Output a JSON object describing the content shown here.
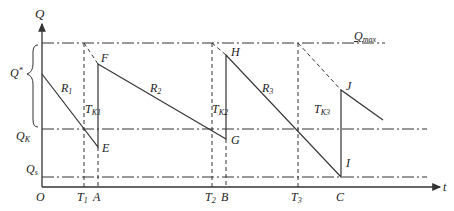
{
  "diagram": {
    "axes": {
      "y_label": "Q",
      "x_label": "t",
      "origin_label": "O"
    },
    "levels": {
      "q_max": {
        "label": "Q",
        "sub": "max"
      },
      "q_k": {
        "label": "Q",
        "sub": "K"
      },
      "q_s": {
        "label": "Q",
        "sub": "s"
      },
      "q_star": {
        "label": "Q",
        "sup": "*"
      }
    },
    "time_marks": [
      {
        "label": "T",
        "sub": "1"
      },
      {
        "label": "A"
      },
      {
        "label": "T",
        "sub": "2"
      },
      {
        "label": "B"
      },
      {
        "label": "T",
        "sub": "3"
      },
      {
        "label": "C"
      }
    ],
    "points": [
      "F",
      "E",
      "H",
      "G",
      "I",
      "J"
    ],
    "segments": [
      {
        "label": "R",
        "sub": "1"
      },
      {
        "label": "R",
        "sub": "2"
      },
      {
        "label": "R",
        "sub": "3"
      }
    ],
    "intervals": [
      {
        "label": "T",
        "sub": "K1"
      },
      {
        "label": "T",
        "sub": "K2"
      },
      {
        "label": "T",
        "sub": "K3"
      }
    ],
    "colors": {
      "line": "#333333",
      "background": "#ffffff"
    }
  }
}
